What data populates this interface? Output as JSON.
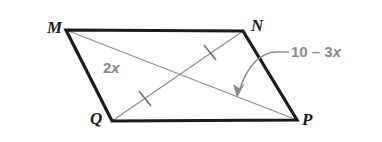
{
  "figure": {
    "type": "parallelogram-with-diagonals",
    "shape_name": "MNPQ",
    "background_color": "#ffffff",
    "side_color": "#1b1b1b",
    "diagonal_color": "#8c8c8c",
    "label_color": "#8a8a8a",
    "vertex_label_color": "#1b1b1b"
  },
  "vertices": [
    {
      "name": "M",
      "label": "M",
      "x": 66,
      "y": 30,
      "label_x": 47,
      "label_y": 19
    },
    {
      "name": "N",
      "label": "N",
      "x": 243,
      "y": 31,
      "label_x": 251,
      "label_y": 17
    },
    {
      "name": "P",
      "label": "P",
      "x": 297,
      "y": 120,
      "label_x": 302,
      "label_y": 111
    },
    {
      "name": "Q",
      "label": "Q",
      "x": 112,
      "y": 121,
      "label_x": 90,
      "label_y": 110
    }
  ],
  "sides": [
    {
      "name": "MN",
      "from": "M",
      "to": "N"
    },
    {
      "name": "NP",
      "from": "N",
      "to": "P"
    },
    {
      "name": "PQ",
      "from": "P",
      "to": "Q"
    },
    {
      "name": "QM",
      "from": "Q",
      "to": "M"
    }
  ],
  "diagonals": [
    {
      "name": "MP",
      "from": "M",
      "to": "P",
      "tick_marks": 1,
      "tick_x": 210,
      "tick_y": 52
    },
    {
      "name": "QN",
      "from": "Q",
      "to": "N",
      "tick_marks": 1,
      "tick_x": 145,
      "tick_y": 98
    }
  ],
  "labels": {
    "diagonal_expression": {
      "text": "2x",
      "prefix": "2",
      "variable": "x",
      "refers_to": "diagonal-MP-segment"
    },
    "side_expression": {
      "text": "10 – 3x",
      "prefix": "10 – 3",
      "variable": "x",
      "refers_to": "diagonal-QN-segment",
      "has_leader_line": true,
      "has_curved_arrow": true
    }
  },
  "intersection": {
    "x": 182,
    "y": 75
  }
}
